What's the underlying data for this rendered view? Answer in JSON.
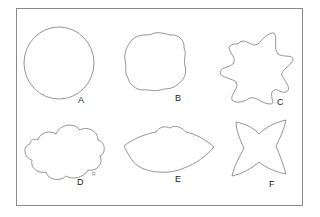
{
  "figure": {
    "shapes": [
      {
        "id": "A",
        "label": "A",
        "description": "circle"
      },
      {
        "id": "B",
        "label": "B",
        "description": "rounded square with wavy edges"
      },
      {
        "id": "C",
        "label": "C",
        "description": "irregular star with curved spikes"
      },
      {
        "id": "D",
        "label": "D",
        "description": "cloud shape"
      },
      {
        "id": "E",
        "label": "E",
        "description": "lemon / eye shape with wavy top"
      },
      {
        "id": "F",
        "label": "F",
        "description": "four-pointed concave star"
      }
    ],
    "mark": "R",
    "colors": {
      "stroke": "#7a7a7a",
      "frame": "#8a8a8a",
      "label": "#222222"
    }
  }
}
